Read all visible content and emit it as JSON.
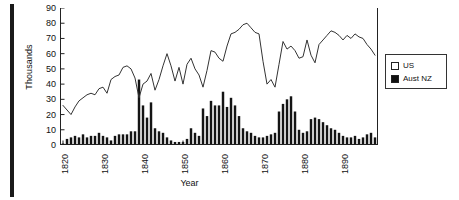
{
  "chart_data": {
    "type": "bar",
    "title": "",
    "xlabel": "Year",
    "ylabel": "Thousands",
    "ylim": [
      0,
      90
    ],
    "ytick_values": [
      0,
      10,
      20,
      30,
      40,
      50,
      60,
      70,
      80,
      90
    ],
    "xlim": [
      1820,
      1898
    ],
    "xtick_values": [
      1820,
      1830,
      1840,
      1850,
      1860,
      1870,
      1880,
      1890
    ],
    "xtick_labels": [
      "1820",
      "1830",
      "1840",
      "1850",
      "1860",
      "1870",
      "1880",
      "1890"
    ],
    "grid": false,
    "legend_position": "right-outside",
    "legend": [
      {
        "label": "US",
        "marker": "hollow-square",
        "color": "#ffffff",
        "series_type": "line"
      },
      {
        "label": "Aust NZ",
        "marker": "filled-square",
        "color": "#111111",
        "series_type": "bar"
      }
    ],
    "x": [
      1820,
      1821,
      1822,
      1823,
      1824,
      1825,
      1826,
      1827,
      1828,
      1829,
      1830,
      1831,
      1832,
      1833,
      1834,
      1835,
      1836,
      1837,
      1838,
      1839,
      1840,
      1841,
      1842,
      1843,
      1844,
      1845,
      1846,
      1847,
      1848,
      1849,
      1850,
      1851,
      1852,
      1853,
      1854,
      1855,
      1856,
      1857,
      1858,
      1859,
      1860,
      1861,
      1862,
      1863,
      1864,
      1865,
      1866,
      1867,
      1868,
      1869,
      1870,
      1871,
      1872,
      1873,
      1874,
      1875,
      1876,
      1877,
      1878,
      1879,
      1880,
      1881,
      1882,
      1883,
      1884,
      1885,
      1886,
      1887,
      1888,
      1889,
      1890,
      1891,
      1892,
      1893,
      1894,
      1895,
      1896,
      1897,
      1898
    ],
    "series": [
      {
        "name": "US",
        "type": "line",
        "units": "thousands of emigrants",
        "values": [
          26,
          23,
          20,
          25,
          29,
          31,
          33,
          34,
          33,
          37,
          38,
          34,
          43,
          45,
          46,
          51,
          52,
          50,
          44,
          31,
          40,
          42,
          47,
          36,
          43,
          52,
          60,
          52,
          42,
          51,
          40,
          53,
          57,
          50,
          46,
          38,
          49,
          62,
          61,
          57,
          55,
          65,
          73,
          74,
          76,
          79,
          80,
          77,
          74,
          73,
          55,
          40,
          43,
          38,
          53,
          68,
          63,
          65,
          62,
          57,
          58,
          69,
          59,
          54,
          66,
          69,
          72,
          75,
          74,
          72,
          69,
          72,
          70,
          73,
          71,
          70,
          66,
          63,
          59
        ]
      },
      {
        "name": "Aust NZ",
        "type": "bar",
        "units": "thousands of emigrants",
        "values": [
          1,
          4,
          5,
          6,
          5,
          7,
          5,
          6,
          6,
          8,
          6,
          5,
          3,
          6,
          7,
          7,
          7,
          9,
          9,
          43,
          26,
          18,
          28,
          11,
          9,
          8,
          5,
          3,
          2,
          2,
          2,
          4,
          11,
          8,
          6,
          24,
          19,
          29,
          26,
          26,
          35,
          25,
          31,
          26,
          19,
          11,
          9,
          8,
          6,
          5,
          5,
          6,
          7,
          8,
          22,
          27,
          30,
          32,
          22,
          10,
          8,
          9,
          17,
          18,
          17,
          15,
          13,
          11,
          10,
          8,
          6,
          5,
          5,
          6,
          4,
          5,
          7,
          8,
          5
        ]
      }
    ]
  }
}
